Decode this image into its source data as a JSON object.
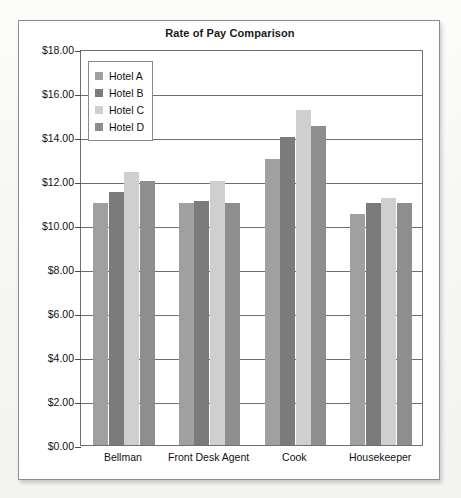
{
  "chart_data": {
    "type": "bar",
    "title": "Rate of Pay Comparison",
    "xlabel": "",
    "ylabel": "",
    "ylim": [
      0,
      18
    ],
    "ytick_step": 2,
    "grid": true,
    "legend_position": "top-left-inside",
    "categories": [
      "Bellman",
      "Front Desk Agent",
      "Cook",
      "Housekeeper"
    ],
    "ytick_labels": [
      "$18.00",
      "$16.00",
      "$14.00",
      "$12.00",
      "$10.00",
      "$8.00",
      "$6.00",
      "$4.00",
      "$2.00",
      "$0.00"
    ],
    "ytick_values": [
      18,
      16,
      14,
      12,
      10,
      8,
      6,
      4,
      2,
      0
    ],
    "series": [
      {
        "name": "Hotel A",
        "color": "#a0a0a0",
        "values": [
          11.0,
          11.0,
          13.0,
          10.5
        ]
      },
      {
        "name": "Hotel B",
        "color": "#7b7b7b",
        "values": [
          11.5,
          11.1,
          14.0,
          11.0
        ]
      },
      {
        "name": "Hotel C",
        "color": "#cfcfcf",
        "values": [
          12.4,
          12.0,
          15.25,
          11.25
        ]
      },
      {
        "name": "Hotel D",
        "color": "#8e8e8e",
        "values": [
          12.0,
          11.0,
          14.5,
          11.0
        ]
      }
    ]
  },
  "legend": {
    "items": [
      {
        "label": "Hotel A"
      },
      {
        "label": "Hotel B"
      },
      {
        "label": "Hotel C"
      },
      {
        "label": "Hotel D"
      }
    ]
  },
  "colors": {
    "frame_border": "#8d8d8d",
    "plot_border": "#6f6f6f",
    "gridline": "#6f6f6f",
    "text": "#111111",
    "background": "#ffffff"
  }
}
